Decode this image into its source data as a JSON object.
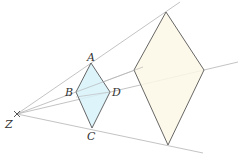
{
  "diagram": {
    "type": "enlargement",
    "centre": {
      "label": "Z",
      "x": 17,
      "y": 114
    },
    "small_shape": {
      "fill": "#d8f2fa",
      "vertices": {
        "A": {
          "x": 91,
          "y": 63
        },
        "B": {
          "x": 76,
          "y": 92
        },
        "C": {
          "x": 92,
          "y": 128
        },
        "D": {
          "x": 110,
          "y": 92
        }
      },
      "labels": {
        "A": "A",
        "B": "B",
        "C": "C",
        "D": "D"
      }
    },
    "large_shape": {
      "fill": "#fdf8e6",
      "vertices": [
        {
          "x": 166,
          "y": 12
        },
        {
          "x": 204,
          "y": 70
        },
        {
          "x": 168,
          "y": 145
        },
        {
          "x": 134,
          "y": 70
        }
      ]
    },
    "ray_color": "#b4b4b4",
    "edge_color": "#555555"
  }
}
